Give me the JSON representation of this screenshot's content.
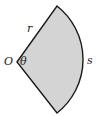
{
  "diagram": {
    "type": "circular-sector",
    "fill_color": "#d4d4d4",
    "stroke_color": "#1a1a1a",
    "labels": {
      "vertex": "O",
      "angle": "θ",
      "radius": "r",
      "arc": "s"
    }
  }
}
